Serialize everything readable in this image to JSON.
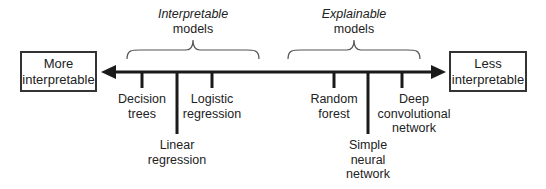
{
  "diagram": {
    "left_end": {
      "line1": "More",
      "line2": "interpretable"
    },
    "right_end": {
      "line1": "Less",
      "line2": "interpretable"
    },
    "groups": [
      {
        "italic": "Interpretable",
        "plain": "models"
      },
      {
        "italic": "Explainable",
        "plain": "models"
      }
    ],
    "models": [
      {
        "line1": "Decision",
        "line2": "trees",
        "line3": ""
      },
      {
        "line1": "Linear",
        "line2": "regression",
        "line3": ""
      },
      {
        "line1": "Logistic",
        "line2": "regression",
        "line3": ""
      },
      {
        "line1": "Random",
        "line2": "forest",
        "line3": ""
      },
      {
        "line1": "Simple",
        "line2": "neural",
        "line3": "network"
      },
      {
        "line1": "Deep",
        "line2": "convolutional",
        "line3": "network"
      }
    ],
    "colors": {
      "line": "#1a1a1a",
      "brace": "#555555",
      "box_border": "#333333",
      "text": "#222222"
    }
  }
}
